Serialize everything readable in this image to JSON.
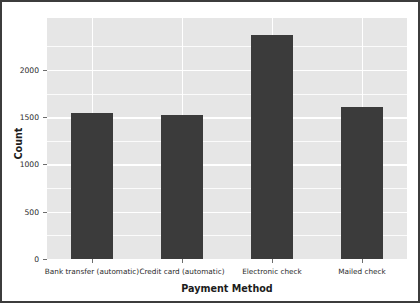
{
  "chart_data": {
    "type": "bar",
    "title": "",
    "xlabel": "Payment Method",
    "ylabel": "Count",
    "categories": [
      "Bank transfer (automatic)",
      "Credit card (automatic)",
      "Electronic check",
      "Mailed check"
    ],
    "values": [
      1544,
      1522,
      2365,
      1612
    ],
    "ylim": [
      0,
      2550
    ],
    "yticks": [
      0,
      500,
      1000,
      1500,
      2000
    ],
    "ytick_labels": [
      "0",
      "500",
      "1000",
      "1500",
      "2000"
    ],
    "grid": true,
    "legend": false,
    "style": {
      "bar_color": "#3b3b3b",
      "plot_background": "#e6e6e6",
      "gridline_color": "#ffffff",
      "figure_background": "#ffffff",
      "text_color": "#1c1c1c"
    }
  }
}
